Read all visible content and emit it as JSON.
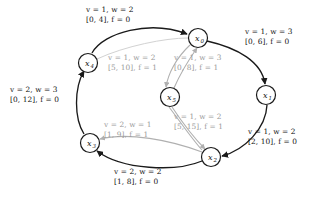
{
  "figure": {
    "kind": "directed-graph",
    "colors": {
      "outer_edge": "#1a1a1a",
      "inner_edge": "#b0b0b0",
      "node_stroke": "#1a1a1a",
      "node_fill": "#ffffff",
      "outer_label_text": "#121212",
      "inner_label_text": "#9a9a9a",
      "background": "#ffffff"
    },
    "nodes": [
      {
        "id": "x0",
        "label": "x",
        "subscript": "0",
        "cx": 198,
        "cy": 38,
        "r": 9.5
      },
      {
        "id": "x1",
        "label": "x",
        "subscript": "1",
        "cx": 266,
        "cy": 95,
        "r": 9.5
      },
      {
        "id": "x2",
        "label": "x",
        "subscript": "2",
        "cx": 211,
        "cy": 157,
        "r": 9.5
      },
      {
        "id": "x3",
        "label": "x",
        "subscript": "3",
        "cx": 90,
        "cy": 143,
        "r": 9.5
      },
      {
        "id": "x4",
        "label": "x",
        "subscript": "4",
        "cx": 88,
        "cy": 63,
        "r": 9.5
      },
      {
        "id": "x5",
        "label": "x",
        "subscript": "5",
        "cx": 170,
        "cy": 97,
        "r": 9.5
      }
    ],
    "outer_edges": [
      {
        "from": "x4",
        "to": "x0",
        "label_position": "top"
      },
      {
        "from": "x0",
        "to": "x1",
        "label_position": "top-right"
      },
      {
        "from": "x1",
        "to": "x2",
        "label_position": "bottom-right"
      },
      {
        "from": "x2",
        "to": "x3",
        "label_position": "bottom"
      },
      {
        "from": "x3",
        "to": "x4",
        "label_position": "left"
      }
    ],
    "inner_edges": [
      {
        "from": "x0",
        "to": "x5",
        "label_position": "inner-upper-left"
      },
      {
        "from": "x5",
        "to": "x0",
        "label_position": "inner-upper-right"
      },
      {
        "from": "x5",
        "to": "x2",
        "label_position": "inner-lower-right"
      },
      {
        "from": "x2",
        "to": "x3",
        "label_position": "inner-lower-left"
      }
    ]
  },
  "labels": {
    "top": {
      "line1": "v = 1, w = 2",
      "line2": "[0, 4], f = 0",
      "v": 1,
      "w": 2,
      "interval": [
        0,
        4
      ],
      "f": 0
    },
    "top_right": {
      "line1": "v = 1, w = 3",
      "line2": "[0, 6], f = 0",
      "v": 1,
      "w": 3,
      "interval": [
        0,
        6
      ],
      "f": 0
    },
    "left": {
      "line1": "v = 2, w = 3",
      "line2": "[0, 12], f = 0",
      "v": 2,
      "w": 3,
      "interval": [
        0,
        12
      ],
      "f": 0
    },
    "bottom_right": {
      "line1": "v = 1, w = 2",
      "line2": "[2, 10], f = 0",
      "v": 1,
      "w": 2,
      "interval": [
        2,
        10
      ],
      "f": 0
    },
    "bottom": {
      "line1": "v = 2, w = 2",
      "line2": "[1, 8], f = 0",
      "v": 2,
      "w": 2,
      "interval": [
        1,
        8
      ],
      "f": 0
    },
    "inner_upper_left": {
      "line1": "v = 1, w = 2",
      "line2": "[5, 10], f = 1",
      "v": 1,
      "w": 2,
      "interval": [
        5,
        10
      ],
      "f": 1
    },
    "inner_upper_right": {
      "line1": "v = 1, w = 3",
      "line2": "[0, 8], f = 1",
      "v": 1,
      "w": 3,
      "interval": [
        0,
        8
      ],
      "f": 1
    },
    "inner_lower_right": {
      "line1": "v = 1, w = 2",
      "line2": "[5, 15], f = 1",
      "v": 1,
      "w": 2,
      "interval": [
        5,
        15
      ],
      "f": 1
    },
    "inner_lower_left": {
      "line1": "v = 2, w = 1",
      "line2": "[1, 9], f = 1",
      "v": 2,
      "w": 1,
      "interval": [
        1,
        9
      ],
      "f": 1
    }
  },
  "node_text": {
    "x0": {
      "base": "x",
      "sub": "0"
    },
    "x1": {
      "base": "x",
      "sub": "1"
    },
    "x2": {
      "base": "x",
      "sub": "2"
    },
    "x3": {
      "base": "x",
      "sub": "3"
    },
    "x4": {
      "base": "x",
      "sub": "4"
    },
    "x5": {
      "base": "x",
      "sub": "5"
    }
  }
}
